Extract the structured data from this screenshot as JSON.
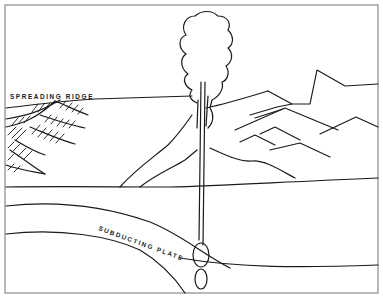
{
  "figure": {
    "type": "geologic cross-section illustration",
    "labels": {
      "spreading_ridge": "SPREADING RIDGE",
      "subducting_plate": "SUBDUCTING PLATE"
    },
    "elements": [
      "spreading-ridge",
      "oceanic-crust-surface",
      "subducting-plate",
      "magma-conduit",
      "magma-blobs",
      "volcanic-eruption-plume",
      "volcano-cone",
      "mountain-range",
      "land-surface"
    ],
    "colors": {
      "line": "#1a1a1a",
      "frame": "#9a9a9a",
      "background": "#ffffff"
    }
  }
}
